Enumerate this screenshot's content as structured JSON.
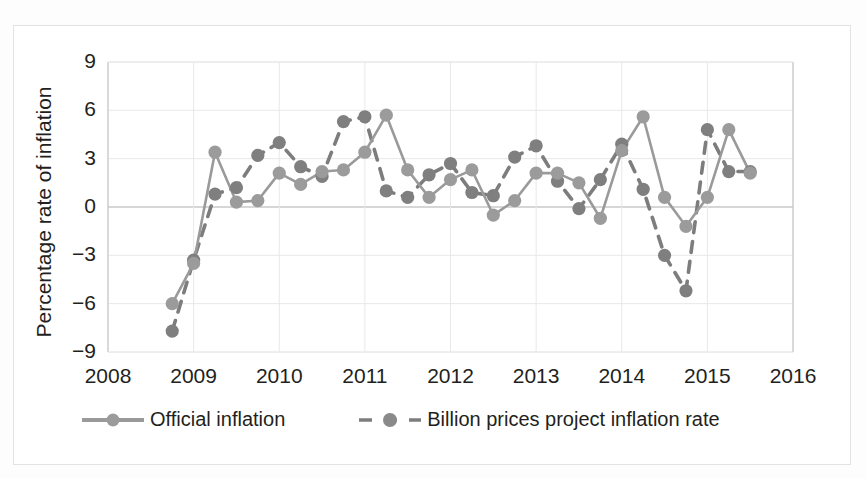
{
  "chart_data": {
    "type": "line",
    "title": "",
    "xlabel": "",
    "ylabel": "Percentage rate of inflation",
    "xlim": [
      2008,
      2016
    ],
    "ylim": [
      -9,
      9
    ],
    "xticks": [
      "2008",
      "2009",
      "2010",
      "2011",
      "2012",
      "2013",
      "2014",
      "2015",
      "2016"
    ],
    "yticks": [
      "9",
      "6",
      "3",
      "0",
      "−3",
      "−6",
      "−9"
    ],
    "grid": true,
    "legend_position": "bottom",
    "series": [
      {
        "name": "Official inflation",
        "style": "solid",
        "color": "#9a9a9a",
        "marker": "circle",
        "x": [
          2008.75,
          2009.0,
          2009.25,
          2009.5,
          2009.75,
          2010.0,
          2010.25,
          2010.5,
          2010.75,
          2011.0,
          2011.25,
          2011.5,
          2011.75,
          2012.0,
          2012.25,
          2012.5,
          2012.75,
          2013.0,
          2013.25,
          2013.5,
          2013.75,
          2014.0,
          2014.25,
          2014.5,
          2014.75,
          2015.0,
          2015.25,
          2015.5
        ],
        "y": [
          -6.0,
          -3.5,
          3.4,
          0.3,
          0.4,
          2.1,
          1.4,
          2.2,
          2.3,
          3.4,
          5.7,
          2.3,
          0.6,
          1.7,
          2.3,
          -0.5,
          0.4,
          2.1,
          2.1,
          1.5,
          -0.7,
          3.5,
          5.6,
          0.6,
          -1.2,
          0.6,
          4.8,
          2.1
        ]
      },
      {
        "name": "Billion prices project inflation rate",
        "style": "dashed",
        "color": "#808080",
        "marker": "circle",
        "x": [
          2008.75,
          2009.0,
          2009.25,
          2009.5,
          2009.75,
          2010.0,
          2010.25,
          2010.5,
          2010.75,
          2011.0,
          2011.25,
          2011.5,
          2011.75,
          2012.0,
          2012.25,
          2012.5,
          2012.75,
          2013.0,
          2013.25,
          2013.5,
          2013.75,
          2014.0,
          2014.25,
          2014.5,
          2014.75,
          2015.0,
          2015.25,
          2015.5
        ],
        "y": [
          -7.7,
          -3.3,
          0.8,
          1.2,
          3.2,
          4.0,
          2.5,
          1.9,
          5.3,
          5.6,
          1.0,
          0.6,
          2.0,
          2.7,
          0.9,
          0.7,
          3.1,
          3.8,
          1.6,
          -0.1,
          1.7,
          3.9,
          1.1,
          -3.0,
          -5.2,
          4.8,
          2.2,
          2.2
        ]
      }
    ]
  },
  "legend": {
    "entries": [
      {
        "label": "Official inflation",
        "style": "solid"
      },
      {
        "label": "Billion prices project inflation rate",
        "style": "dashed"
      }
    ]
  },
  "colors": {
    "solid_line": "#9a9a9a",
    "dashed_line": "#7d7d7d",
    "marker": "#9b9b9b",
    "marker_dark": "#7f7f7f",
    "grid": "#e8e8e8",
    "axis": "#c9c9c9",
    "text": "#231f20",
    "frame": "#e3e3e3"
  }
}
